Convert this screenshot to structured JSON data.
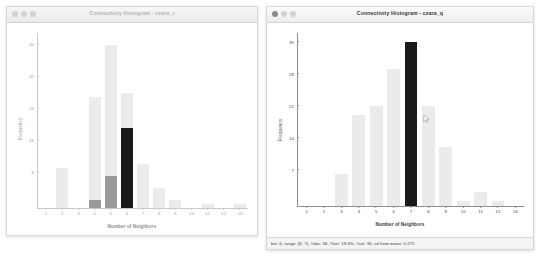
{
  "desktop": {
    "background": "#ffffff"
  },
  "windows": [
    {
      "id": "left",
      "title": "Connectivity Histogram - ceara_r",
      "active": false,
      "has_statusbar": false,
      "statusbar": ""
    },
    {
      "id": "right",
      "title": "Connectivity Histogram - ceara_q",
      "active": true,
      "has_statusbar": true,
      "statusbar": "bin: 6, range: [6, 7), #obs: 36, %tot: 19.6%, #sel: 36, sd from mean: 0.272"
    }
  ],
  "colors": {
    "bar_unselected": "#ebebeb",
    "bar_selected": "#1a1a1a",
    "bar_partial": "#9a9a9a",
    "axis_left": "#c9c9c9",
    "axis_right": "#8f8f8f",
    "title_inactive": "#b4b4b4",
    "title_active": "#3a3a3a"
  },
  "chart_data": [
    {
      "type": "bar",
      "id": "ceara_r",
      "title": "Connectivity Histogram - ceara_r",
      "xlabel": "Number of Neighbors",
      "ylabel": "Frequency",
      "categories": [
        "1",
        "2",
        "3",
        "4",
        "5",
        "6",
        "7",
        "8",
        "9",
        "10",
        "11",
        "12",
        "13"
      ],
      "yticks": [
        8,
        16,
        24,
        32,
        40
      ],
      "ylim": [
        0,
        44
      ],
      "grid": false,
      "legend": null,
      "series": [
        {
          "name": "total",
          "values": [
            0,
            10,
            0,
            28,
            41,
            29,
            11,
            5,
            2,
            0,
            1,
            0,
            1
          ]
        },
        {
          "name": "selected",
          "values": [
            0,
            0,
            0,
            2,
            8,
            20,
            0,
            0,
            0,
            0,
            0,
            0,
            0
          ]
        }
      ]
    },
    {
      "type": "bar",
      "id": "ceara_q",
      "title": "Connectivity Histogram - ceara_q",
      "xlabel": "Number of Neighbors",
      "ylabel": "Frequency",
      "categories": [
        "1",
        "2",
        "3",
        "4",
        "5",
        "6",
        "7",
        "8",
        "9",
        "10",
        "11",
        "12",
        "13"
      ],
      "yticks": [
        7,
        14,
        21,
        28,
        35
      ],
      "ylim": [
        0,
        38
      ],
      "grid": false,
      "legend": null,
      "series": [
        {
          "name": "total",
          "values": [
            0,
            0,
            7,
            20,
            22,
            30,
            36,
            22,
            13,
            1,
            3,
            1,
            0
          ]
        },
        {
          "name": "selected",
          "values": [
            0,
            0,
            0,
            0,
            0,
            0,
            36,
            0,
            0,
            0,
            0,
            0,
            0
          ]
        }
      ]
    }
  ]
}
